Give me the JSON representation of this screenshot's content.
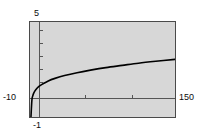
{
  "chart_data": {
    "type": "line",
    "title": "",
    "subtitle": "",
    "xlabel": "",
    "ylabel": "",
    "xlim": [
      -1,
      150
    ],
    "ylim": [
      -10,
      5
    ],
    "grid": false,
    "legend": null,
    "background_color": "#d7d7d7",
    "frame_color": "#4a4a4a",
    "curve_color": "#000000",
    "axis_labels": {
      "y_max": "5",
      "y_min": "-10",
      "x_min": "-1",
      "x_max": "150"
    },
    "axis_crossing": {
      "x": 0,
      "y": -10
    },
    "x_ticks": [
      50,
      100
    ],
    "y_ticks": [
      -8,
      -6,
      -4,
      -2,
      0,
      2,
      4
    ],
    "series": [
      {
        "name": "curve",
        "x": [
          0,
          1,
          2,
          3,
          5,
          8,
          12,
          18,
          25,
          35,
          48,
          62,
          78,
          95,
          112,
          130,
          150
        ],
        "y": [
          -10.0,
          -7.3,
          -6.6,
          -6.2,
          -5.7,
          -5.2,
          -4.8,
          -4.3,
          -3.9,
          -3.45,
          -3.0,
          -2.6,
          -2.2,
          -1.85,
          -1.5,
          -1.2,
          -0.9
        ]
      }
    ]
  }
}
